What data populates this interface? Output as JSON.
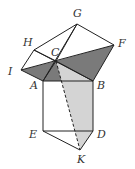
{
  "diagram": {
    "points": {
      "G": {
        "x": 77,
        "y": 24
      },
      "H": {
        "x": 34,
        "y": 50
      },
      "F": {
        "x": 114,
        "y": 45
      },
      "C": {
        "x": 56,
        "y": 61
      },
      "I": {
        "x": 21,
        "y": 70
      },
      "A": {
        "x": 43,
        "y": 81
      },
      "B": {
        "x": 93,
        "y": 81
      },
      "E": {
        "x": 43,
        "y": 131
      },
      "D": {
        "x": 93,
        "y": 131
      },
      "K": {
        "x": 80,
        "y": 150
      }
    },
    "labels": {
      "G": "G",
      "H": "H",
      "F": "F",
      "C": "C",
      "I": "I",
      "A": "A",
      "B": "B",
      "E": "E",
      "D": "D",
      "K": "K"
    },
    "colors": {
      "stroke": "#222222",
      "dark_fill": "#7a7a7a",
      "light_fill": "#d4d4d4"
    }
  }
}
